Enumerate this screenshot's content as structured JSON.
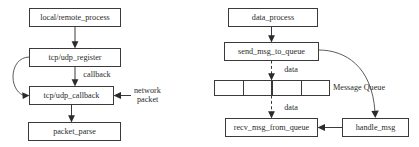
{
  "diagrams": [
    {
      "id": "socket-callback-flow",
      "nodes": [
        {
          "id": "local_remote_process",
          "label": "local/remote_process"
        },
        {
          "id": "tcp_udp_register",
          "label": "tcp/udp_register"
        },
        {
          "id": "tcp_udp_callback",
          "label": "tcp/udp_callback"
        },
        {
          "id": "packet_parse",
          "label": "packet_parse"
        }
      ],
      "edge_labels": {
        "callback": "callback",
        "network_packet_line1": "network",
        "network_packet_line2": "packet"
      }
    },
    {
      "id": "message-queue-flow",
      "nodes": [
        {
          "id": "data_process",
          "label": "data_process"
        },
        {
          "id": "send_msg_to_queue",
          "label": "send_msg_to_queue"
        },
        {
          "id": "recv_msg_from_queue",
          "label": "recv_msg_from_queue"
        },
        {
          "id": "handle_msg",
          "label": "handle_msg"
        }
      ],
      "queue": {
        "label": "Message Queue",
        "cells": 4
      },
      "edge_labels": {
        "data_top": "data",
        "data_bottom": "data"
      }
    }
  ],
  "colors": {
    "stroke": "#3a3a3a",
    "text": "#2b2b2b",
    "background": "#ffffff"
  }
}
